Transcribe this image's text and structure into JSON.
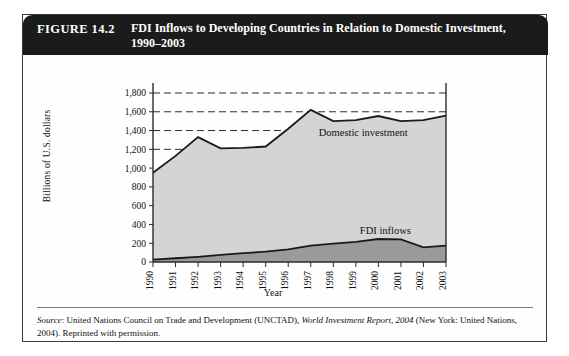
{
  "figure": {
    "number": "FIGURE 14.2",
    "title": "FDI Inflows to Developing Countries in Relation to Domestic Investment, 1990–2003",
    "source_label": "Source",
    "source_text_1": ": United Nations Council on Trade and Development (UNCTAD), ",
    "source_italic": "World Investment Report, 2004",
    "source_text_2": " (New York: United Nations, 2004). Reprinted with permission."
  },
  "colors": {
    "header_bg": "#1b1b1b",
    "header_text": "#ffffff",
    "domestic_fill": "#d4d4d4",
    "fdi_fill": "#9a9a9a",
    "line": "#1a1a1a",
    "grid": "#2b2b2b",
    "card_border": "#3a3a3a"
  },
  "chart_data": {
    "type": "area",
    "title": "FDI Inflows to Developing Countries in Relation to Domestic Investment, 1990–2003",
    "xlabel": "Year",
    "ylabel": "Billions of U.S. dollars",
    "categories": [
      "1990",
      "1991",
      "1992",
      "1993",
      "1994",
      "1995",
      "1996",
      "1997",
      "1998",
      "1999",
      "2000",
      "2001",
      "2002",
      "2003"
    ],
    "ylim": [
      0,
      1800
    ],
    "yticks": [
      "0",
      "200",
      "400",
      "600",
      "800",
      "1,000",
      "1,200",
      "1,400",
      "1,600",
      "1,800"
    ],
    "ytick_values": [
      0,
      200,
      400,
      600,
      800,
      1000,
      1200,
      1400,
      1600,
      1800
    ],
    "grid": "horizontal-dashed",
    "legend": "inline-labels",
    "series": [
      {
        "name": "Domestic investment",
        "values": [
          950,
          1130,
          1330,
          1210,
          1215,
          1230,
          1420,
          1620,
          1500,
          1510,
          1555,
          1500,
          1510,
          1560
        ]
      },
      {
        "name": "FDI inflows",
        "values": [
          25,
          40,
          55,
          75,
          95,
          110,
          135,
          175,
          195,
          215,
          245,
          240,
          155,
          175
        ]
      }
    ]
  }
}
